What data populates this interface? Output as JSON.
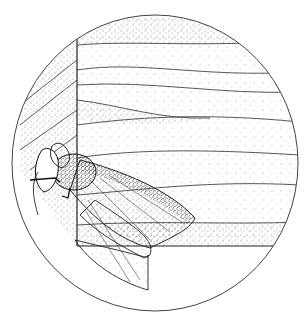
{
  "illustration": {
    "subject": "moth resting under edge of wooden board",
    "style": "pen-and-ink stipple drawing in circular vignette",
    "colors": {
      "background": "#ffffff",
      "ink": "#1a1a1a",
      "line": "#333333"
    },
    "elements": [
      {
        "name": "circular-frame"
      },
      {
        "name": "wood-board"
      },
      {
        "name": "moth"
      }
    ]
  }
}
